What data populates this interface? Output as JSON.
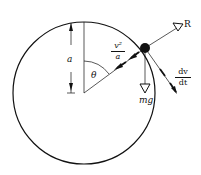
{
  "diagram": {
    "labels": {
      "radius": "a",
      "angle": "θ",
      "reaction": "R",
      "weight": "mg",
      "centripetal_num": "v²",
      "centripetal_den": "a",
      "tangential_num": "dv",
      "tangential_den": "dt"
    },
    "colors": {
      "stroke": "#111111",
      "background": "#ffffff"
    }
  }
}
